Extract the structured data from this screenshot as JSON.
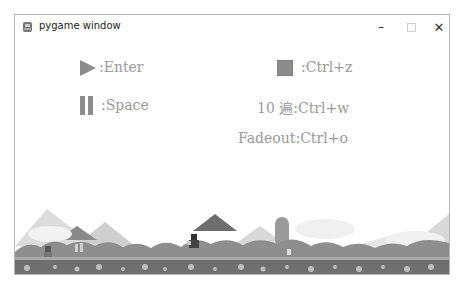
{
  "window": {
    "title": "pygame window",
    "controls": {
      "minimize": "–",
      "maximize": "□",
      "close": "✕"
    }
  },
  "hints": [
    {
      "icon": "play-icon",
      "label": ":Enter"
    },
    {
      "icon": "pause-icon",
      "label": ":Space"
    },
    {
      "icon": "stop-icon",
      "label": ":Ctrl+z"
    },
    {
      "icon": null,
      "label": "10 遍:Ctrl+w"
    },
    {
      "icon": null,
      "label": "Fadeout:Ctrl+o"
    }
  ],
  "colors": {
    "hint_text": "#9a9a9a",
    "icon_gray": "#8c8c8c",
    "ground_dark": "#6f6f6f",
    "bush": "#8e8e8e",
    "mountain_light": "#d6d6d6",
    "mountain_dark": "#7d7d7d"
  }
}
